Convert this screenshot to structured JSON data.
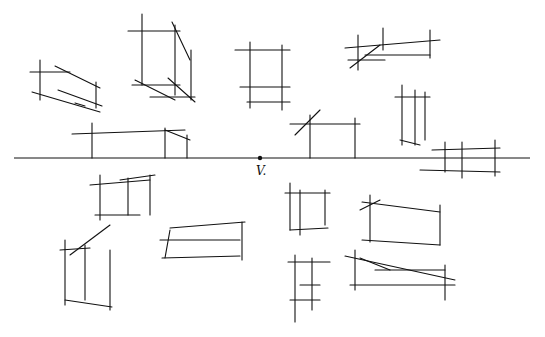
{
  "diagram": {
    "vanishing_point": {
      "label": "V.",
      "x": 260,
      "y": 158
    },
    "horizon_line": {
      "x1": 14,
      "x2": 530,
      "y": 158
    },
    "stroke_color": "#111111",
    "boxes": [
      {
        "name": "box-upper-left-flat",
        "lines": [
          [
            30,
            72,
            70,
            72
          ],
          [
            40,
            60,
            40,
            100
          ],
          [
            32,
            92,
            100,
            112
          ],
          [
            55,
            66,
            100,
            88
          ],
          [
            58,
            90,
            102,
            106
          ],
          [
            96,
            82,
            96,
            108
          ],
          [
            75,
            103,
            85,
            106
          ]
        ]
      },
      {
        "name": "box-upper-tall",
        "lines": [
          [
            128,
            31,
            180,
            31
          ],
          [
            142,
            14,
            142,
            85
          ],
          [
            175,
            25,
            175,
            95
          ],
          [
            172,
            22,
            190,
            60
          ],
          [
            191,
            50,
            191,
            100
          ],
          [
            135,
            80,
            175,
            100
          ],
          [
            168,
            78,
            195,
            102
          ],
          [
            132,
            85,
            180,
            85
          ],
          [
            150,
            97,
            195,
            97
          ]
        ]
      },
      {
        "name": "box-upper-center",
        "lines": [
          [
            235,
            50,
            290,
            50
          ],
          [
            250,
            42,
            250,
            108
          ],
          [
            282,
            45,
            282,
            110
          ],
          [
            240,
            87,
            290,
            87
          ],
          [
            247,
            102,
            290,
            102
          ]
        ]
      },
      {
        "name": "box-upper-right-flat",
        "lines": [
          [
            345,
            48,
            440,
            40
          ],
          [
            358,
            35,
            358,
            70
          ],
          [
            383,
            28,
            383,
            50
          ],
          [
            365,
            55,
            430,
            55
          ],
          [
            348,
            60,
            385,
            60
          ],
          [
            350,
            68,
            380,
            45
          ],
          [
            430,
            30,
            430,
            58
          ]
        ]
      },
      {
        "name": "box-right-tall",
        "lines": [
          [
            395,
            97,
            430,
            97
          ],
          [
            402,
            85,
            402,
            145
          ],
          [
            415,
            90,
            415,
            145
          ],
          [
            425,
            92,
            425,
            140
          ],
          [
            400,
            140,
            420,
            145
          ]
        ]
      },
      {
        "name": "box-horizon-left",
        "lines": [
          [
            72,
            134,
            185,
            130
          ],
          [
            92,
            123,
            92,
            158
          ],
          [
            165,
            128,
            165,
            158
          ],
          [
            165,
            130,
            190,
            140
          ],
          [
            187,
            135,
            187,
            158
          ]
        ]
      },
      {
        "name": "box-horizon-center",
        "lines": [
          [
            290,
            124,
            360,
            124
          ],
          [
            310,
            115,
            310,
            158
          ],
          [
            355,
            118,
            355,
            158
          ],
          [
            295,
            135,
            320,
            110
          ]
        ]
      },
      {
        "name": "box-horizon-right",
        "lines": [
          [
            432,
            150,
            500,
            148
          ],
          [
            445,
            142,
            445,
            172
          ],
          [
            462,
            142,
            462,
            178
          ],
          [
            495,
            140,
            495,
            176
          ],
          [
            420,
            170,
            500,
            172
          ]
        ]
      },
      {
        "name": "box-lower-left",
        "lines": [
          [
            90,
            185,
            150,
            180
          ],
          [
            100,
            175,
            100,
            220
          ],
          [
            128,
            178,
            128,
            215
          ],
          [
            150,
            175,
            150,
            215
          ],
          [
            95,
            215,
            140,
            215
          ],
          [
            120,
            180,
            155,
            175
          ]
        ]
      },
      {
        "name": "box-lower-left-tall",
        "lines": [
          [
            60,
            250,
            90,
            248
          ],
          [
            65,
            240,
            65,
            305
          ],
          [
            85,
            245,
            85,
            300
          ],
          [
            110,
            250,
            110,
            310
          ],
          [
            65,
            300,
            112,
            307
          ],
          [
            70,
            255,
            110,
            225
          ]
        ]
      },
      {
        "name": "box-lower-mid-flat",
        "lines": [
          [
            170,
            228,
            245,
            222
          ],
          [
            160,
            240,
            240,
            240
          ],
          [
            162,
            258,
            240,
            256
          ],
          [
            170,
            230,
            165,
            258
          ],
          [
            242,
            222,
            242,
            260
          ]
        ]
      },
      {
        "name": "box-lower-center",
        "lines": [
          [
            285,
            193,
            330,
            193
          ],
          [
            290,
            183,
            290,
            230
          ],
          [
            325,
            190,
            325,
            225
          ],
          [
            300,
            190,
            300,
            235
          ],
          [
            290,
            230,
            328,
            228
          ]
        ]
      },
      {
        "name": "box-lower-right",
        "lines": [
          [
            362,
            202,
            440,
            212
          ],
          [
            370,
            195,
            370,
            242
          ],
          [
            440,
            205,
            440,
            245
          ],
          [
            362,
            240,
            440,
            245
          ],
          [
            360,
            210,
            380,
            200
          ]
        ]
      },
      {
        "name": "box-lower-center-tall",
        "lines": [
          [
            288,
            262,
            330,
            262
          ],
          [
            295,
            255,
            295,
            322
          ],
          [
            312,
            258,
            312,
            310
          ],
          [
            300,
            285,
            320,
            285
          ],
          [
            290,
            300,
            320,
            300
          ]
        ]
      },
      {
        "name": "box-lower-right-flat",
        "lines": [
          [
            345,
            256,
            455,
            280
          ],
          [
            355,
            250,
            355,
            290
          ],
          [
            375,
            270,
            445,
            270
          ],
          [
            350,
            285,
            455,
            285
          ],
          [
            360,
            258,
            390,
            270
          ],
          [
            445,
            265,
            445,
            300
          ]
        ]
      }
    ]
  }
}
